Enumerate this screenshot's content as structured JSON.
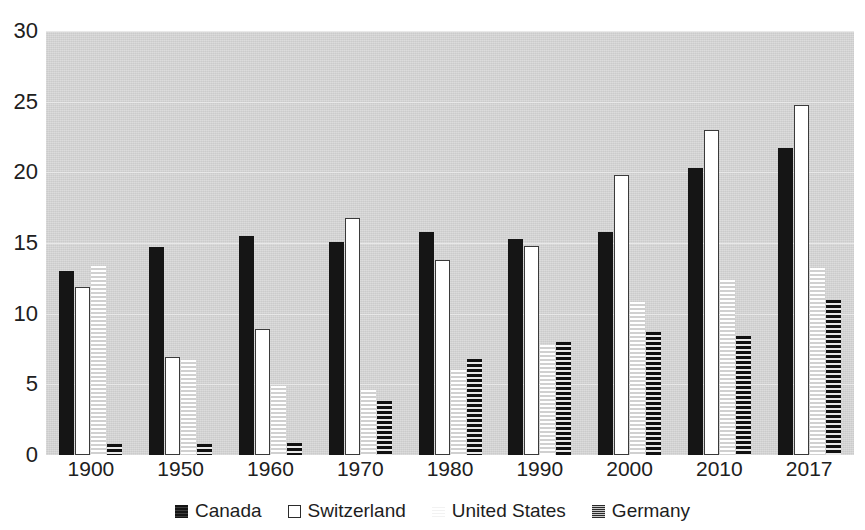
{
  "chart_data": {
    "type": "bar",
    "title": "",
    "subtitle": "",
    "xlabel": "",
    "ylabel": "",
    "categories": [
      "1900",
      "1950",
      "1960",
      "1970",
      "1980",
      "1990",
      "2000",
      "2010",
      "2017"
    ],
    "series": [
      {
        "name": "Canada",
        "values": [
          13.0,
          14.7,
          15.5,
          15.1,
          15.8,
          15.3,
          15.8,
          20.3,
          21.7
        ]
      },
      {
        "name": "Switzerland",
        "values": [
          11.9,
          6.9,
          8.9,
          16.8,
          13.8,
          14.8,
          19.8,
          23.0,
          24.8
        ]
      },
      {
        "name": "United States",
        "values": [
          13.4,
          6.7,
          4.9,
          4.6,
          6.0,
          7.8,
          10.8,
          12.4,
          13.2
        ]
      },
      {
        "name": "Germany",
        "values": [
          0.8,
          0.8,
          0.85,
          3.8,
          6.8,
          8.0,
          8.7,
          8.4,
          11.0
        ]
      }
    ],
    "ylim": [
      0,
      30
    ],
    "yticks": [
      0,
      5,
      10,
      15,
      20,
      25,
      30
    ],
    "ytick_labels": [
      "0",
      "5",
      "10",
      "15",
      "20",
      "25",
      "30"
    ],
    "grid": true,
    "grid_axis": "y",
    "legend_position": "bottom",
    "legend": [
      "Canada",
      "Switzerland",
      "United States",
      "Germany"
    ],
    "plot_background": "#d5d5d5",
    "colors": {
      "canada": "#151515",
      "switzerland": "#ffffff",
      "united_states": "#ffffff",
      "germany": "#111111"
    }
  }
}
